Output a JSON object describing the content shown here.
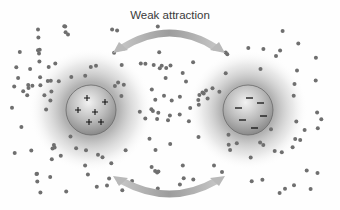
{
  "diagram": {
    "title_label": "Weak attraction",
    "left_particle": {
      "charge": "positive",
      "symbol": "+",
      "count": 6
    },
    "right_particle": {
      "charge": "negative",
      "symbol": "−",
      "count": 6
    },
    "arrows": [
      {
        "position": "top",
        "direction": "bidirectional"
      },
      {
        "position": "bottom",
        "direction": "bidirectional"
      }
    ],
    "colors": {
      "background": "#fefefe",
      "halo": "#8a8a8a",
      "sphere": "#b5b5b5",
      "dot": "#6f6f6f",
      "arrow": "#a8a8a8",
      "charge_symbol": "#1a1a1a"
    }
  }
}
